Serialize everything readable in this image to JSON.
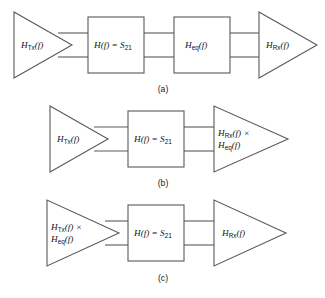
{
  "figure": {
    "background_color": "#ffffff",
    "line_color": "#5a5a5a",
    "text_color": "#111111"
  },
  "diagrams": [
    {
      "caption": "(a)",
      "blocks": [
        {
          "kind": "triangle",
          "name": "tx-amplifier",
          "label_lines": [
            {
              "base": "H",
              "sub": "Tx",
              "tail": "(f)"
            }
          ],
          "label_plain": "H_Tx(f)"
        },
        {
          "kind": "rectangle",
          "name": "channel-block",
          "label_lines": [
            {
              "base": "H",
              "sub": "",
              "tail": "(f) = S",
              "sub2": "21"
            }
          ],
          "label_plain": "H(f) = S21"
        },
        {
          "kind": "rectangle",
          "name": "equalizer-block",
          "label_lines": [
            {
              "base": "H",
              "sub": "eq",
              "tail": "(f)"
            }
          ],
          "label_plain": "H_eq(f)"
        },
        {
          "kind": "triangle",
          "name": "rx-amplifier",
          "label_lines": [
            {
              "base": "H",
              "sub": "Rx",
              "tail": "(f)"
            }
          ],
          "label_plain": "H_Rx(f)"
        }
      ]
    },
    {
      "caption": "(b)",
      "blocks": [
        {
          "kind": "triangle",
          "name": "tx-amplifier",
          "label_lines": [
            {
              "base": "H",
              "sub": "Tx",
              "tail": "(f)"
            }
          ],
          "label_plain": "H_Tx(f)"
        },
        {
          "kind": "rectangle",
          "name": "channel-block",
          "label_lines": [
            {
              "base": "H",
              "sub": "",
              "tail": "(f) = S",
              "sub2": "21"
            }
          ],
          "label_plain": "H(f) = S21"
        },
        {
          "kind": "triangle",
          "name": "rx-amplifier-with-equalizer",
          "label_lines": [
            {
              "base": "H",
              "sub": "Rx",
              "tail": "(f) ×"
            },
            {
              "base": "H",
              "sub": "eq",
              "tail": "(f)"
            }
          ],
          "label_plain": "H_Rx(f) × H_eq(f)"
        }
      ]
    },
    {
      "caption": "(c)",
      "blocks": [
        {
          "kind": "triangle",
          "name": "tx-amplifier-with-equalizer",
          "label_lines": [
            {
              "base": "H",
              "sub": "Tx",
              "tail": "(f) ×"
            },
            {
              "base": "H",
              "sub": "eq",
              "tail": "(f)"
            }
          ],
          "label_plain": "H_Tx(f) × H_eq(f)"
        },
        {
          "kind": "rectangle",
          "name": "channel-block",
          "label_lines": [
            {
              "base": "H",
              "sub": "",
              "tail": "(f) = S",
              "sub2": "21"
            }
          ],
          "label_plain": "H(f) = S21"
        },
        {
          "kind": "triangle",
          "name": "rx-amplifier",
          "label_lines": [
            {
              "base": "H",
              "sub": "Rx",
              "tail": "(f)"
            }
          ],
          "label_plain": "H_Rx(f)"
        }
      ]
    }
  ],
  "labels": {
    "a": {
      "tx": {
        "h": "H",
        "sub": "Tx",
        "tail": "(f)"
      },
      "channel": {
        "h": "H",
        "tail": "(f) = S",
        "sub": "21"
      },
      "eq": {
        "h": "H",
        "sub": "eq",
        "tail": "(f)"
      },
      "rx": {
        "h": "H",
        "sub": "Rx",
        "tail": "(f)"
      },
      "caption": "(a)"
    },
    "b": {
      "tx": {
        "h": "H",
        "sub": "Tx",
        "tail": "(f)"
      },
      "channel": {
        "h": "H",
        "tail": "(f) = S",
        "sub": "21"
      },
      "rx_line1": {
        "h": "H",
        "sub": "Rx",
        "tail": "(f) ×"
      },
      "rx_line2": {
        "h": "H",
        "sub": "eq",
        "tail": "(f)"
      },
      "caption": "(b)"
    },
    "c": {
      "tx_line1": {
        "h": "H",
        "sub": "Tx",
        "tail": "(f) ×"
      },
      "tx_line2": {
        "h": "H",
        "sub": "eq",
        "tail": "(f)"
      },
      "channel": {
        "h": "H",
        "tail": "(f) = S",
        "sub": "21"
      },
      "rx": {
        "h": "H",
        "sub": "Rx",
        "tail": "(f)"
      },
      "caption": "(c)"
    }
  }
}
